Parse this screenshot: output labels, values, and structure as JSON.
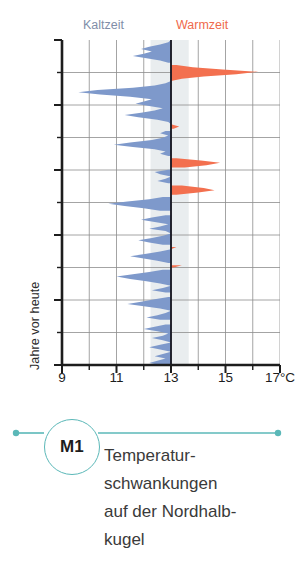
{
  "figure": {
    "yaxis_title": "Jahre vor heute",
    "yticks": [
      "0",
      "200 000",
      "400 000",
      "600 000",
      "800 000",
      "1 000 000"
    ],
    "xticks": [
      "9",
      "11",
      "13",
      "15",
      "17°C"
    ],
    "band_left_label": "Kaltzeit",
    "band_right_label": "Warmzeit"
  },
  "caption": {
    "badge": "M1",
    "text": "Temperatur­schwankungen auf der Nordhalb­kugel",
    "line1": "Temperatur-",
    "line2": "schwankungen",
    "line3": "auf der Nordhalb-",
    "line4": "kugel"
  },
  "colors": {
    "cold": "#7e99cb",
    "warm": "#f3704f",
    "cold_label": "#7f8ea8",
    "warm_label": "#ef6a4c",
    "axis": "#1d1d1d",
    "grid": "#8d8d8d",
    "center_band": "#e9edef",
    "teal": "#5bb8b8"
  },
  "chart_data": {
    "type": "area",
    "xlabel": "°C",
    "ylabel": "Jahre vor heute",
    "xlim": [
      9,
      17
    ],
    "ylim": [
      0,
      1000000
    ],
    "y_inverted": true,
    "grid": true,
    "legend_position": "top",
    "baseline": 13,
    "baseline_label": "13°C",
    "categories": [
      "Kaltzeit",
      "Warmzeit"
    ],
    "legend": [
      {
        "name": "Kaltzeit",
        "color": "#7e99cb",
        "side": "left"
      },
      {
        "name": "Warmzeit",
        "color": "#f3704f",
        "side": "right"
      }
    ],
    "xtick_values": [
      9,
      10,
      11,
      12,
      13,
      14,
      15,
      16,
      17
    ],
    "xtick_labels": [
      "9",
      "",
      "11",
      "",
      "13",
      "",
      "15",
      "",
      "17°C"
    ],
    "ytick_values": [
      0,
      100000,
      200000,
      300000,
      400000,
      500000,
      600000,
      700000,
      800000,
      900000,
      1000000
    ],
    "ytick_labels": [
      "0",
      "",
      "200 000",
      "",
      "400 000",
      "",
      "600 000",
      "",
      "800 000",
      "",
      "1 000 000"
    ],
    "series": [
      {
        "name": "Temperatur",
        "x": [
          13.0,
          12.9,
          12.6,
          12.2,
          11.9,
          12.3,
          12.0,
          11.6,
          12.1,
          12.6,
          12.9,
          13.2,
          13.8,
          14.9,
          16.2,
          15.4,
          14.2,
          13.4,
          13.0,
          12.8,
          12.4,
          11.6,
          10.3,
          9.6,
          10.4,
          11.5,
          12.3,
          12.0,
          11.7,
          12.2,
          12.7,
          12.4,
          11.9,
          11.3,
          11.8,
          12.5,
          12.9,
          13.0,
          13.3,
          13.1,
          12.8,
          12.6,
          12.9,
          12.7,
          12.3,
          11.5,
          10.9,
          11.6,
          12.4,
          12.8,
          12.6,
          12.9,
          13.2,
          14.1,
          14.8,
          14.3,
          13.5,
          12.9,
          12.4,
          12.6,
          13.0,
          12.8,
          12.5,
          12.9,
          13.4,
          14.2,
          14.6,
          14.0,
          13.2,
          12.7,
          12.2,
          11.4,
          10.7,
          11.3,
          12.0,
          12.6,
          13.1,
          12.8,
          12.3,
          11.9,
          12.4,
          12.9,
          12.6,
          12.2,
          12.8,
          13.0,
          12.7,
          12.3,
          11.8,
          12.2,
          12.7,
          13.2,
          13.0,
          12.6,
          12.1,
          11.5,
          12.0,
          12.5,
          12.9,
          13.4,
          13.1,
          12.7,
          12.2,
          11.6,
          11.0,
          11.5,
          12.1,
          12.6,
          13.0,
          12.7,
          12.3,
          12.8,
          13.2,
          12.9,
          12.4,
          11.9,
          11.4,
          12.0,
          12.6,
          13.0,
          12.8,
          12.5,
          12.1,
          12.6,
          13.1,
          12.8,
          12.4,
          12.0,
          12.5,
          12.9,
          12.7,
          12.3,
          12.7,
          13.0,
          12.6,
          12.2,
          12.6,
          13.0,
          12.7,
          12.4,
          12.8,
          12.5,
          12.2,
          12.6,
          12.9,
          12.6,
          12.3,
          12.7,
          12.4,
          13.0
        ],
        "y": [
          0,
          7000,
          14000,
          21000,
          28000,
          35000,
          42000,
          49000,
          56000,
          63000,
          70000,
          77000,
          84000,
          91000,
          98000,
          105000,
          112000,
          119000,
          126000,
          133000,
          140000,
          147000,
          154000,
          161000,
          168000,
          175000,
          182000,
          189000,
          196000,
          203000,
          210000,
          217000,
          224000,
          231000,
          238000,
          245000,
          252000,
          259000,
          266000,
          273000,
          280000,
          287000,
          294000,
          301000,
          308000,
          315000,
          322000,
          329000,
          336000,
          343000,
          350000,
          357000,
          364000,
          371000,
          378000,
          385000,
          392000,
          399000,
          406000,
          413000,
          420000,
          427000,
          434000,
          441000,
          448000,
          455000,
          462000,
          469000,
          476000,
          483000,
          490000,
          497000,
          504000,
          511000,
          518000,
          525000,
          532000,
          539000,
          546000,
          553000,
          560000,
          567000,
          574000,
          581000,
          588000,
          595000,
          602000,
          609000,
          616000,
          623000,
          630000,
          637000,
          644000,
          651000,
          658000,
          665000,
          672000,
          679000,
          686000,
          693000,
          700000,
          707000,
          714000,
          721000,
          728000,
          735000,
          742000,
          749000,
          756000,
          763000,
          770000,
          777000,
          784000,
          791000,
          798000,
          805000,
          812000,
          819000,
          826000,
          833000,
          840000,
          847000,
          854000,
          861000,
          868000,
          875000,
          882000,
          889000,
          896000,
          903000,
          910000,
          917000,
          924000,
          931000,
          938000,
          945000,
          952000,
          959000,
          966000,
          973000,
          980000,
          987000,
          994000,
          1000000,
          1000000,
          1000000,
          1000000,
          1000000,
          1000000,
          1000000
        ]
      }
    ]
  }
}
